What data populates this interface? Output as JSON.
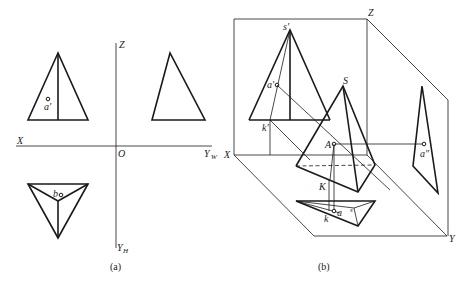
{
  "figure_a": {
    "caption": "(a)",
    "axes": {
      "z": "Z",
      "x": "X",
      "origin": "O",
      "yw": "Y",
      "yw_sub": "W",
      "yh": "Y",
      "yh_sub": "H"
    },
    "points": {
      "front_point": "a'",
      "top_point": "b"
    }
  },
  "figure_b": {
    "caption": "(b)",
    "axes": {
      "z": "Z",
      "x": "X",
      "y": "Y"
    },
    "points": {
      "s_front": "s'",
      "a_front": "a'",
      "k_front": "k'",
      "apex": "S",
      "point_A": "A",
      "point_K": "K",
      "k_top": "k",
      "a_top": "a",
      "s_top": "s",
      "a_side": "a\""
    }
  }
}
